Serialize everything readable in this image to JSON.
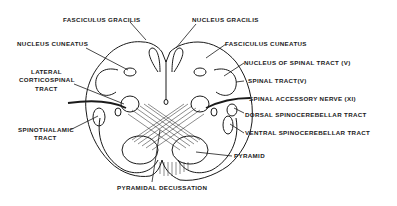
{
  "diagram": {
    "labels": {
      "fasciculus_gracilis": "FASCICULUS GRACILIS",
      "nucleus_gracilis": "NUCLEUS GRACILIS",
      "nucleus_cuneatus": "NUCLEUS CUNEATUS",
      "fasciculus_cuneatus": "FASCICULUS CUNEATUS",
      "nucleus_spinal_tract": "NUCLEUS OF SPINAL TRACT (V)",
      "lateral_corticospinal_1": "LATERAL",
      "lateral_corticospinal_2": "CORTICOSPINAL",
      "lateral_corticospinal_3": "TRACT",
      "spinal_tract": "SPINAL TRACT(V)",
      "spinal_accessory": "SPINAL ACCESSORY NERVE (XI)",
      "dorsal_spinocerebellar": "DORSAL SPINOCEREBELLAR TRACT",
      "spinothalamic_1": "SPINOTHALAMIC",
      "spinothalamic_2": "TRACT",
      "ventral_spinocerebellar": "VENTRAL SPINOCEREBELLAR TRACT",
      "pyramid": "PYRAMID",
      "pyramidal_decussation": "PYRAMIDAL DECUSSATION"
    },
    "colors": {
      "ink": "#1a1a1a",
      "background": "#ffffff"
    }
  }
}
